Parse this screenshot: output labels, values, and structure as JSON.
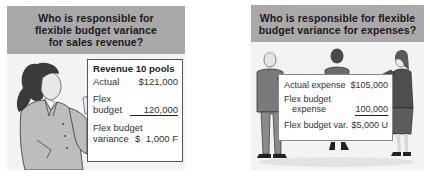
{
  "left_panel": {
    "banner": {
      "lines": [
        "Who is responsible for",
        "flexible budget variance",
        "for sales revenue?"
      ]
    },
    "illustration": "woman-presenting-card",
    "card": {
      "title": "Revenue 10 pools",
      "rows": [
        {
          "label": "Actual",
          "value": "$121,000"
        },
        {
          "label_line1": "Flex",
          "label_line2": "budget",
          "value": "120,000"
        },
        {
          "label_line1": "Flex budget",
          "label_line2": "variance",
          "currency": "$",
          "value": "1,000 F"
        }
      ]
    }
  },
  "right_panel": {
    "banner": {
      "lines": [
        "Who is responsible for flexible",
        "budget variance for expenses?"
      ]
    },
    "illustration": "three-people-holding-sign",
    "sign": {
      "rows": [
        {
          "label": "Actual expense",
          "value": "$105,000"
        },
        {
          "label_line1": "Flex budget",
          "label_line2": "expense",
          "value": "100,000"
        },
        {
          "label": "Flex budget var.",
          "value": "$5,000 U"
        }
      ]
    }
  },
  "colors": {
    "banner_bg": "#a9a9a9",
    "panel_bg": "#f3f3f3",
    "card_bg": "#ffffff",
    "text": "#222222"
  }
}
